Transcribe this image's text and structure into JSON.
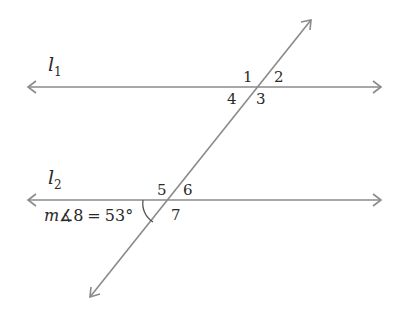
{
  "diagram": {
    "line1": {
      "name": "l",
      "subscript": "1"
    },
    "line2": {
      "name": "l",
      "subscript": "2"
    },
    "angles_top": [
      "1",
      "2",
      "3",
      "4"
    ],
    "angles_bottom": [
      "5",
      "6",
      "7"
    ],
    "given": {
      "prefix": "m",
      "angle_symbol": "∡",
      "angle": "8",
      "equals": "=",
      "value": "53°"
    },
    "colors": {
      "line": "#8a8a8a",
      "text": "#2a2a2a"
    }
  }
}
